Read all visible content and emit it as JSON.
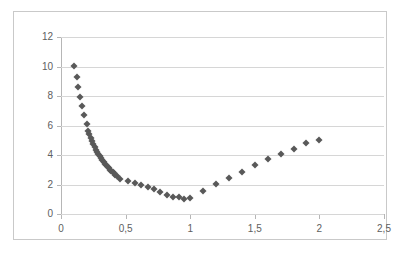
{
  "chart_data": {
    "type": "scatter",
    "title": "",
    "subtitle": "",
    "xlabel": "",
    "ylabel": "",
    "xlim": [
      0,
      2.5
    ],
    "ylim": [
      0,
      12
    ],
    "grid": true,
    "legend": false,
    "legend_position": "none",
    "marker_shape": "diamond",
    "marker_color": "#595959",
    "decimal_separator": ",",
    "x_ticks": [
      0,
      0.5,
      1,
      1.5,
      2,
      2.5
    ],
    "x_tick_labels": [
      "0",
      "0,5",
      "1",
      "1,5",
      "2",
      "2,5"
    ],
    "y_ticks": [
      0,
      2,
      4,
      6,
      8,
      10,
      12
    ],
    "y_tick_labels": [
      "0",
      "2",
      "4",
      "6",
      "8",
      "10",
      "12"
    ],
    "series": [
      {
        "name": "series1",
        "points": [
          [
            0.1,
            10.01
          ],
          [
            0.12,
            9.27
          ],
          [
            0.13,
            8.61
          ],
          [
            0.15,
            7.96
          ],
          [
            0.16,
            7.31
          ],
          [
            0.18,
            6.68
          ],
          [
            0.2,
            6.07
          ],
          [
            0.21,
            5.63
          ],
          [
            0.22,
            5.41
          ],
          [
            0.23,
            5.18
          ],
          [
            0.24,
            4.97
          ],
          [
            0.25,
            4.75
          ],
          [
            0.26,
            4.53
          ],
          [
            0.27,
            4.36
          ],
          [
            0.28,
            4.22
          ],
          [
            0.29,
            4.06
          ],
          [
            0.3,
            3.92
          ],
          [
            0.31,
            3.78
          ],
          [
            0.32,
            3.65
          ],
          [
            0.33,
            3.52
          ],
          [
            0.34,
            3.41
          ],
          [
            0.35,
            3.3
          ],
          [
            0.36,
            3.19
          ],
          [
            0.37,
            3.09
          ],
          [
            0.38,
            3.0
          ],
          [
            0.39,
            2.91
          ],
          [
            0.4,
            2.83
          ],
          [
            0.41,
            2.75
          ],
          [
            0.42,
            2.67
          ],
          [
            0.43,
            2.6
          ],
          [
            0.46,
            2.38
          ],
          [
            0.52,
            2.22
          ],
          [
            0.57,
            2.07
          ],
          [
            0.62,
            1.96
          ],
          [
            0.67,
            1.84
          ],
          [
            0.72,
            1.72
          ],
          [
            0.77,
            1.52
          ],
          [
            0.82,
            1.32
          ],
          [
            0.87,
            1.18
          ],
          [
            0.91,
            1.12
          ],
          [
            0.95,
            1.04
          ],
          [
            1.0,
            1.06
          ],
          [
            1.1,
            1.58
          ],
          [
            1.2,
            2.02
          ],
          [
            1.3,
            2.45
          ],
          [
            1.4,
            2.87
          ],
          [
            1.5,
            3.3
          ],
          [
            1.6,
            3.7
          ],
          [
            1.7,
            4.06
          ],
          [
            1.8,
            4.43
          ],
          [
            1.9,
            4.78
          ],
          [
            2.0,
            5.05
          ]
        ]
      }
    ]
  }
}
